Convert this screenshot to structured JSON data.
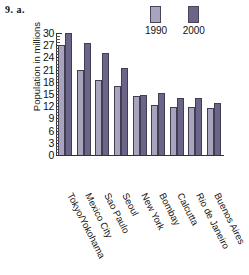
{
  "problem_label": "9. a.",
  "legend": {
    "entries": [
      {
        "label": "1990",
        "color": "#a9a4bd",
        "icon": "legend-swatch-icon"
      },
      {
        "label": "2000",
        "color": "#6d6589",
        "icon": "legend-swatch-icon"
      }
    ]
  },
  "chart_data": {
    "type": "bar",
    "title": "",
    "xlabel": "",
    "ylabel": "Population in millions",
    "ylim": [
      0,
      30
    ],
    "ytick_step": 3,
    "yticks": [
      0,
      3,
      6,
      9,
      12,
      15,
      18,
      21,
      24,
      27,
      30
    ],
    "ytick_labels": [
      "0",
      "3",
      "6",
      "9",
      "12",
      "15",
      "18",
      "21",
      "24",
      "27",
      "30"
    ],
    "minor_ticks": true,
    "grid": false,
    "legend_position": "top-right",
    "categories": [
      "Tokyo/Yokohama",
      "Mexico City",
      "Sao Paulo",
      "Seoul",
      "New York",
      "Bombay",
      "Calcutta",
      "Rio de Janeiro",
      "Buenos Aires"
    ],
    "series": [
      {
        "name": "1990",
        "color": "#a9a4bd",
        "values": [
          27,
          21,
          18.5,
          17,
          14.6,
          12.2,
          11.8,
          11.8,
          11.6
        ]
      },
      {
        "name": "2000",
        "color": "#6d6589",
        "values": [
          30,
          27.5,
          25,
          21.5,
          14.7,
          15.3,
          14,
          14,
          12.8
        ]
      }
    ]
  }
}
